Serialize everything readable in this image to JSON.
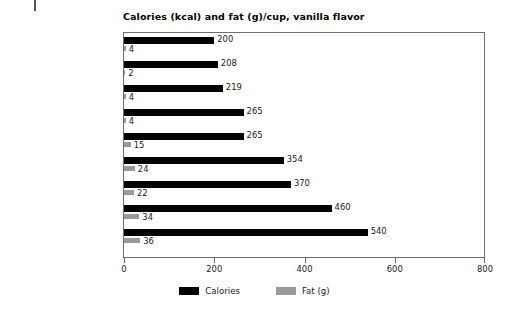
{
  "chart_data": {
    "type": "bar",
    "orientation": "horizontal",
    "title": "Calories (kcal) and fat (g)/cup, vanilla flavor",
    "xlabel": "",
    "ylabel": "",
    "xlim": [
      0,
      800
    ],
    "xticks": [
      0,
      200,
      400,
      600,
      800
    ],
    "xtick_labels": [
      "0",
      "200",
      "400",
      "600",
      "800"
    ],
    "grid": false,
    "legend_position": "bottom-center",
    "categories": [
      "Low-fat Ice Cream",
      "Frozen Yogurt/Nonfat",
      "Frozen Yogurt/Low-fat",
      "Sherbet (orange)",
      "Ice Cream/10% fat",
      "Ice Cream/16% fat",
      "Soft Serve",
      "Ice Cream/Ben & Jerry's",
      "Ice Cream/Häagen Dazs"
    ],
    "series": [
      {
        "name": "Calories",
        "color": "#000000",
        "values": [
          200,
          208,
          219,
          265,
          265,
          354,
          370,
          460,
          540
        ],
        "labels": [
          "200",
          "208",
          "219",
          "265",
          "265",
          "354",
          "370",
          "460",
          "540"
        ]
      },
      {
        "name": "Fat (g)",
        "color": "#9a9a9a",
        "values": [
          4,
          2,
          4,
          4,
          15,
          24,
          22,
          34,
          36
        ],
        "labels": [
          "4",
          "2",
          "4",
          "4",
          "15",
          "24",
          "22",
          "34",
          "36"
        ]
      }
    ]
  },
  "legend": {
    "items": [
      {
        "label": "Calories",
        "color": "#000000"
      },
      {
        "label": "Fat (g)",
        "color": "#9a9a9a"
      }
    ]
  }
}
